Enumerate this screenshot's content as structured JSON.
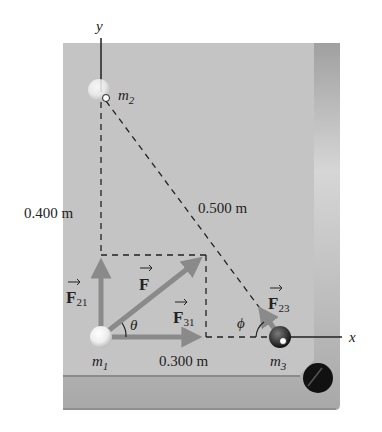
{
  "figure": {
    "axes": {
      "x_label": "x",
      "y_label": "y"
    },
    "masses": [
      {
        "id": "m1",
        "label": "m",
        "sub": "1"
      },
      {
        "id": "m2",
        "label": "m",
        "sub": "2"
      },
      {
        "id": "m3",
        "label": "m",
        "sub": "3"
      }
    ],
    "distances": {
      "vertical": "0.400 m",
      "horizontal": "0.300 m",
      "diagonal": "0.500 m"
    },
    "forces": {
      "net": {
        "label": "F",
        "sub": ""
      },
      "f21": {
        "label": "F",
        "sub": "21"
      },
      "f31": {
        "label": "F",
        "sub": "31"
      },
      "f23": {
        "label": "F",
        "sub": "23"
      }
    },
    "angles": {
      "theta": "θ",
      "phi": "ϕ"
    },
    "colors": {
      "table_felt": "#c4c4c4",
      "rail": "#b8b8b8",
      "vector": "#8a8a8a",
      "dash": "#222222",
      "pocket": "#111111"
    }
  }
}
